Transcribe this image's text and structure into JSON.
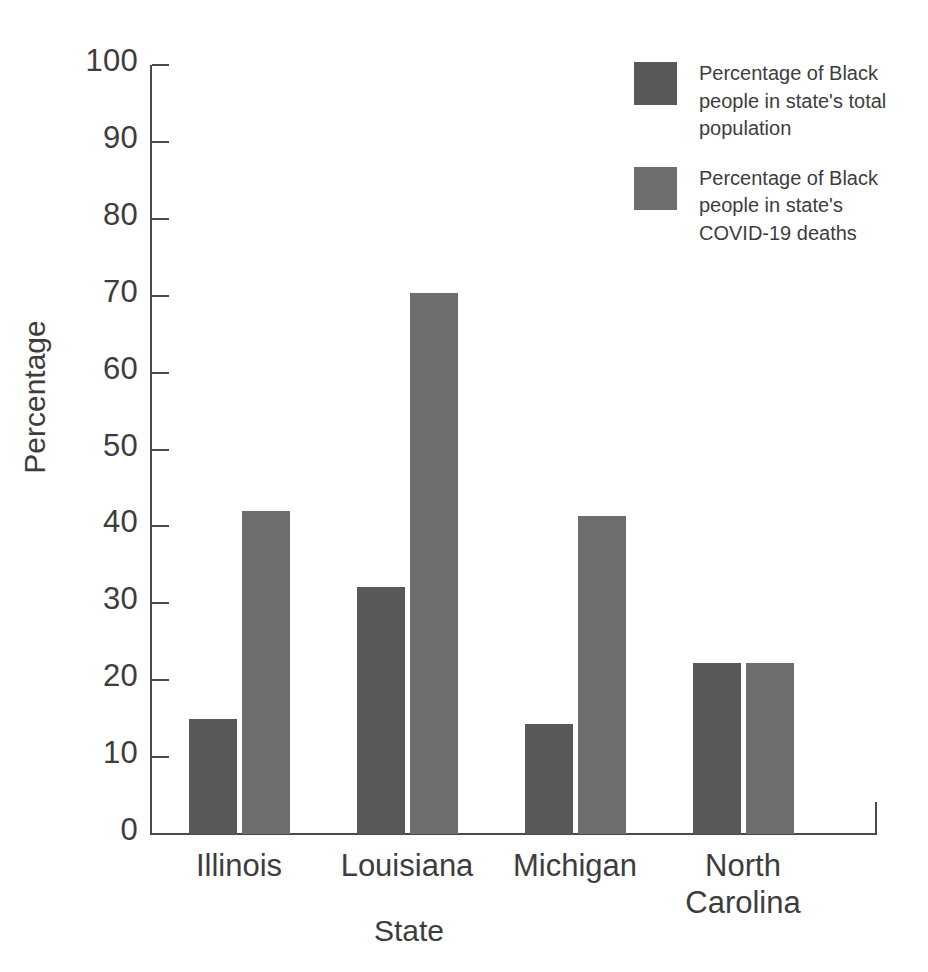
{
  "chart_data": {
    "type": "bar",
    "title": "",
    "xlabel": "State",
    "ylabel": "Percentage",
    "ylim": [
      0,
      100
    ],
    "ytick_values": [
      100,
      90,
      80,
      70,
      60,
      50,
      40,
      30,
      20,
      10,
      0
    ],
    "ytick_labels": [
      "100",
      "90",
      "80",
      "70",
      "60",
      "50",
      "40",
      "30",
      "20",
      "10",
      "0"
    ],
    "grid": false,
    "legend_position": "top-right",
    "categories": [
      "Illinois",
      "Louisiana",
      "Michigan",
      "North Carolina"
    ],
    "category_label_lines": [
      [
        "Illinois"
      ],
      [
        "Louisiana"
      ],
      [
        "Michigan"
      ],
      [
        "North",
        "Carolina"
      ]
    ],
    "series": [
      {
        "name": "Percentage of Black people in state's total population",
        "color": "#595959",
        "values": [
          15.0,
          32.1,
          14.3,
          22.3
        ]
      },
      {
        "name": "Percentage of Black people in state's COVID-19 deaths",
        "color": "#6e6e6e",
        "values": [
          42.0,
          70.3,
          41.3,
          22.3
        ]
      }
    ]
  },
  "legend": {
    "entries": [
      {
        "swatch_color": "#595959",
        "label": "Percentage of Black people in state's total population"
      },
      {
        "swatch_color": "#6e6e6e",
        "label": "Percentage of Black people in state's COVID-19 deaths"
      }
    ]
  },
  "axes": {
    "y_title": "Percentage",
    "x_title": "State"
  },
  "colors": {
    "series_0": "#595959",
    "series_1": "#6e6e6e",
    "axis": "#4a4a4a",
    "text": "#3d3d3d",
    "background": "#ffffff"
  }
}
